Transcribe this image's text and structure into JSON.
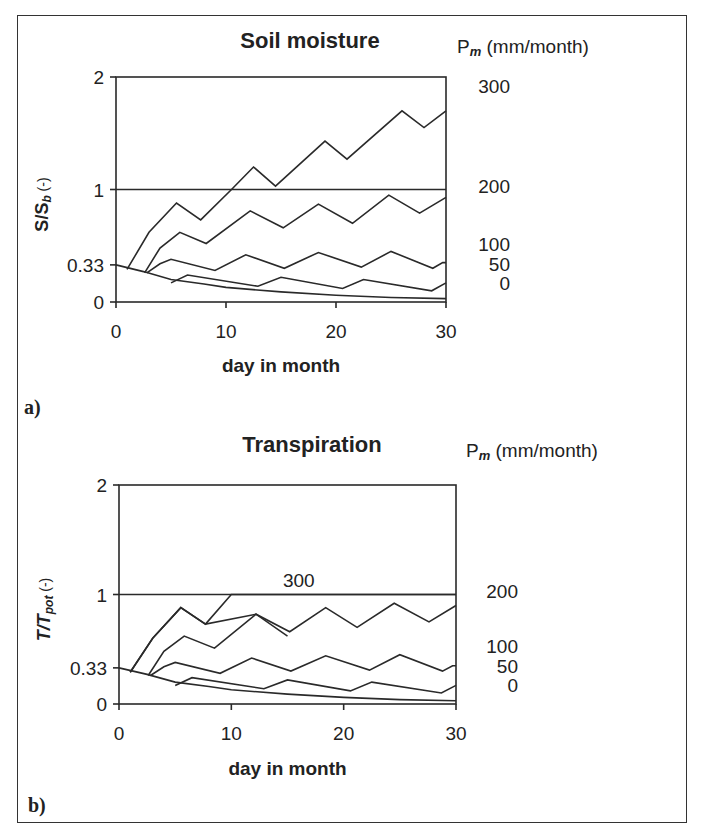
{
  "chart_data": [
    {
      "type": "line",
      "panel": "a)",
      "title": "Soil moisture",
      "xlabel": "day in month",
      "ylabel": "S/S_b (-)",
      "ylabel_main": "S/S",
      "ylabel_sub": "b",
      "ylabel_suffix": " (-)",
      "right_axis_title": "P",
      "right_axis_title_sub": "m",
      "right_axis_title_suffix": " (mm/month)",
      "xlim": [
        0,
        30
      ],
      "ylim": [
        0,
        2
      ],
      "x_ticks": [
        0,
        10,
        20,
        30
      ],
      "y_ticks": [
        {
          "value": 0,
          "label": "0"
        },
        {
          "value": 0.33,
          "label": "0.33"
        },
        {
          "value": 1,
          "label": "1"
        },
        {
          "value": 2,
          "label": "2"
        }
      ],
      "reference_line": 1,
      "series_labels": [
        {
          "name": "300",
          "y": 1.92
        },
        {
          "name": "200",
          "y": 1.03
        },
        {
          "name": "100",
          "y": 0.52
        },
        {
          "name": "50",
          "y": 0.34
        },
        {
          "name": "0",
          "y": 0.17
        }
      ],
      "series": [
        {
          "name": "300",
          "points": [
            [
              1,
              0.29
            ],
            [
              3,
              0.62
            ],
            [
              5.5,
              0.88
            ],
            [
              7.7,
              0.73
            ],
            [
              10.5,
              1.0
            ],
            [
              12.5,
              1.2
            ],
            [
              14.5,
              1.03
            ],
            [
              19,
              1.43
            ],
            [
              21,
              1.27
            ],
            [
              26,
              1.7
            ],
            [
              28,
              1.55
            ],
            [
              30,
              1.7
            ]
          ]
        },
        {
          "name": "200",
          "points": [
            [
              2.6,
              0.26
            ],
            [
              4,
              0.48
            ],
            [
              5.8,
              0.62
            ],
            [
              8.2,
              0.52
            ],
            [
              12.2,
              0.81
            ],
            [
              15.2,
              0.66
            ],
            [
              18.4,
              0.87
            ],
            [
              21.5,
              0.7
            ],
            [
              24.8,
              0.95
            ],
            [
              27.6,
              0.79
            ],
            [
              30,
              0.93
            ]
          ]
        },
        {
          "name": "100",
          "points": [
            [
              2.8,
              0.26
            ],
            [
              4,
              0.34
            ],
            [
              5,
              0.38
            ],
            [
              9,
              0.28
            ],
            [
              11.8,
              0.42
            ],
            [
              15.3,
              0.3
            ],
            [
              18.4,
              0.44
            ],
            [
              22.3,
              0.31
            ],
            [
              25,
              0.45
            ],
            [
              28.8,
              0.3
            ],
            [
              29.7,
              0.35
            ],
            [
              30,
              0.35
            ]
          ]
        },
        {
          "name": "50",
          "points": [
            [
              5,
              0.17
            ],
            [
              6.5,
              0.24
            ],
            [
              12.9,
              0.14
            ],
            [
              15,
              0.22
            ],
            [
              20.6,
              0.12
            ],
            [
              22.5,
              0.2
            ],
            [
              28.7,
              0.1
            ],
            [
              30,
              0.17
            ]
          ]
        },
        {
          "name": "0",
          "points": [
            [
              0,
              0.33
            ],
            [
              2.5,
              0.27
            ],
            [
              5,
              0.2
            ],
            [
              8,
              0.16
            ],
            [
              10,
              0.13
            ],
            [
              15,
              0.09
            ],
            [
              20,
              0.06
            ],
            [
              25,
              0.04
            ],
            [
              30,
              0.03
            ]
          ]
        }
      ]
    },
    {
      "type": "line",
      "panel": "b)",
      "title": "Transpiration",
      "xlabel": "day in month",
      "ylabel": "T/T_pot (-)",
      "ylabel_main": "T/T",
      "ylabel_sub": "pot",
      "ylabel_suffix": " (-)",
      "right_axis_title": "P",
      "right_axis_title_sub": "m",
      "right_axis_title_suffix": " (mm/month)",
      "xlim": [
        0,
        30
      ],
      "ylim": [
        0,
        2
      ],
      "x_ticks": [
        0,
        10,
        20,
        30
      ],
      "y_ticks": [
        {
          "value": 0,
          "label": "0"
        },
        {
          "value": 0.33,
          "label": "0.33"
        },
        {
          "value": 1,
          "label": "1"
        },
        {
          "value": 2,
          "label": "2"
        }
      ],
      "reference_line": 1,
      "inline_label": {
        "text": "300",
        "x": 16,
        "y": 1.07
      },
      "series_labels": [
        {
          "name": "200",
          "y": 1.03
        },
        {
          "name": "100",
          "y": 0.53
        },
        {
          "name": "50",
          "y": 0.35
        },
        {
          "name": "0",
          "y": 0.17
        }
      ],
      "series": [
        {
          "name": "300",
          "points": [
            [
              1,
              0.29
            ],
            [
              3,
              0.6
            ],
            [
              5.5,
              0.88
            ],
            [
              7.7,
              0.73
            ],
            [
              10,
              1.0
            ],
            [
              30,
              1.0
            ]
          ]
        },
        {
          "name": "200",
          "points": [
            [
              1,
              0.29
            ],
            [
              3,
              0.6
            ],
            [
              5.5,
              0.88
            ],
            [
              7.7,
              0.73
            ],
            [
              12.2,
              0.82
            ],
            [
              15.2,
              0.66
            ],
            [
              18.4,
              0.88
            ],
            [
              21.2,
              0.7
            ],
            [
              24.5,
              0.92
            ],
            [
              27.6,
              0.75
            ],
            [
              30,
              0.9
            ]
          ]
        },
        {
          "name": "100",
          "points": [
            [
              2.6,
              0.26
            ],
            [
              4,
              0.48
            ],
            [
              5.8,
              0.62
            ],
            [
              8.5,
              0.51
            ],
            [
              12.2,
              0.82
            ],
            [
              15,
              0.62
            ]
          ]
        },
        {
          "name": "100b",
          "points": [
            [
              2.8,
              0.26
            ],
            [
              4,
              0.34
            ],
            [
              5,
              0.38
            ],
            [
              9,
              0.28
            ],
            [
              11.8,
              0.42
            ],
            [
              15.3,
              0.3
            ],
            [
              18.4,
              0.44
            ],
            [
              22.3,
              0.31
            ],
            [
              25,
              0.45
            ],
            [
              28.8,
              0.3
            ],
            [
              29.7,
              0.35
            ],
            [
              30,
              0.35
            ]
          ]
        },
        {
          "name": "50",
          "points": [
            [
              5,
              0.17
            ],
            [
              6.5,
              0.24
            ],
            [
              12.9,
              0.14
            ],
            [
              15,
              0.22
            ],
            [
              20.6,
              0.12
            ],
            [
              22.5,
              0.2
            ],
            [
              28.7,
              0.1
            ],
            [
              30,
              0.17
            ]
          ]
        },
        {
          "name": "0",
          "points": [
            [
              0,
              0.33
            ],
            [
              2.5,
              0.27
            ],
            [
              5,
              0.2
            ],
            [
              8,
              0.16
            ],
            [
              10,
              0.13
            ],
            [
              15,
              0.09
            ],
            [
              20,
              0.06
            ],
            [
              25,
              0.04
            ],
            [
              30,
              0.03
            ]
          ]
        }
      ]
    }
  ]
}
